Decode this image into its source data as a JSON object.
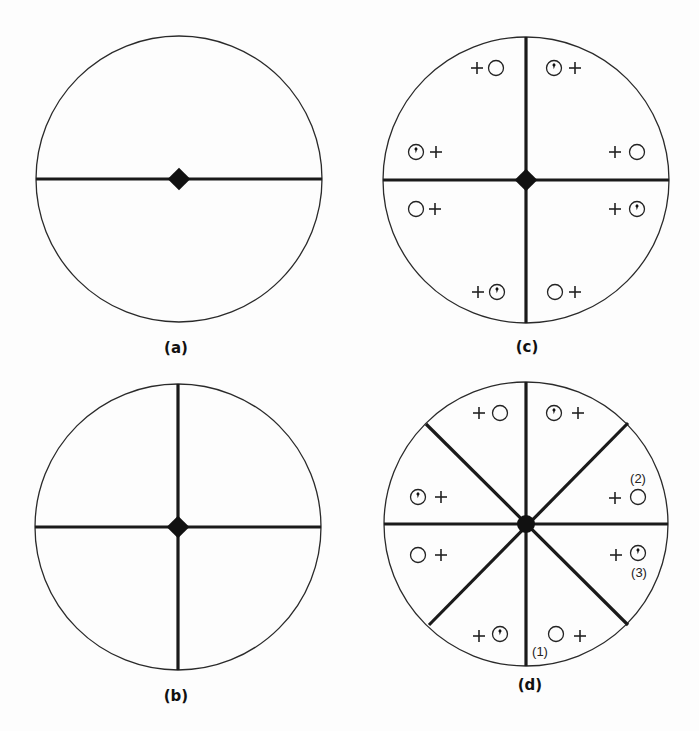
{
  "figure": {
    "panels": [
      {
        "id": "a",
        "label": "(a)",
        "center": [
          179,
          179
        ],
        "radius": 143,
        "dividers_deg": [
          0
        ],
        "symbols": []
      },
      {
        "id": "b",
        "label": "(b)",
        "center": [
          178,
          527
        ],
        "radius": 143,
        "dividers_deg": [
          0,
          90
        ],
        "symbols": []
      },
      {
        "id": "c",
        "label": "(c)",
        "center": [
          526,
          180
        ],
        "radius": 143,
        "dividers_deg": [
          0,
          90
        ],
        "symbols": [
          {
            "group": "top-left",
            "items": [
              "plus",
              "open-circle"
            ]
          },
          {
            "group": "top-right",
            "items": [
              "dotted-circle",
              "plus"
            ]
          },
          {
            "group": "left-upper",
            "items": [
              "dotted-circle",
              "plus"
            ]
          },
          {
            "group": "right-upper",
            "items": [
              "plus",
              "open-circle"
            ]
          },
          {
            "group": "left-lower",
            "items": [
              "open-circle",
              "plus"
            ]
          },
          {
            "group": "right-lower",
            "items": [
              "plus",
              "dotted-circle"
            ]
          },
          {
            "group": "bottom-left",
            "items": [
              "plus",
              "dotted-circle"
            ]
          },
          {
            "group": "bottom-right",
            "items": [
              "open-circle",
              "plus"
            ]
          }
        ]
      },
      {
        "id": "d",
        "label": "(d)",
        "center": [
          526,
          524
        ],
        "radius": 142,
        "dividers_deg": [
          0,
          45,
          90,
          135
        ],
        "symbols": [
          {
            "group": "top-left",
            "items": [
              "plus",
              "open-circle"
            ]
          },
          {
            "group": "top-right",
            "items": [
              "dotted-circle",
              "plus"
            ]
          },
          {
            "group": "left-upper",
            "items": [
              "dotted-circle",
              "plus"
            ]
          },
          {
            "group": "right-upper",
            "items": [
              "plus",
              "open-circle"
            ],
            "annotation": "(2)"
          },
          {
            "group": "left-lower",
            "items": [
              "open-circle",
              "plus"
            ]
          },
          {
            "group": "right-lower",
            "items": [
              "plus",
              "dotted-circle"
            ],
            "annotation": "(3)"
          },
          {
            "group": "bottom-left",
            "items": [
              "plus",
              "dotted-circle"
            ]
          },
          {
            "group": "bottom-right",
            "items": [
              "open-circle",
              "plus"
            ],
            "annotation": "(1)"
          }
        ]
      }
    ],
    "annotations": {
      "one": "(1)",
      "two": "(2)",
      "three": "(3)"
    },
    "legend_symbols": {
      "plus": "plus-icon",
      "open-circle": "open-circle-icon",
      "dotted-circle": "dotted-circle-icon",
      "hub": "diamond-hub-icon"
    },
    "colors": {
      "background": "#fdfdfd",
      "ink": "#111111"
    }
  }
}
